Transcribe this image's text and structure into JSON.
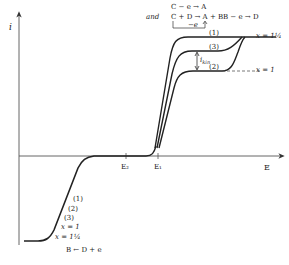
{
  "diagram": {
    "axes": {
      "y_label": "i",
      "x_label": "E",
      "x_ticks": [
        {
          "label": "E₂",
          "x": 126
        },
        {
          "label": "E₁",
          "x": 158
        }
      ]
    },
    "annotations": {
      "reaction_top_1": "C − e → A",
      "reaction_and": "and",
      "reaction_top_2": "C + D → A + B",
      "reaction_bracket": "−e",
      "reaction_right": "B − e → D",
      "reaction_bottom": "B ← D + e",
      "i_kin_label": "i",
      "i_kin_sub": "kin"
    },
    "anodic_curves": [
      {
        "label": "(1)",
        "plateau_note": "x = 1¼"
      },
      {
        "label": "(3)"
      },
      {
        "label": "(2)",
        "plateau_note": "x = 1"
      }
    ],
    "cathodic_labels": [
      "(1)",
      "(2)",
      "(3)",
      "x = 1",
      "x = 1¼"
    ],
    "right_labels": {
      "top": "x = 1¼",
      "bottom": "x = 1"
    }
  }
}
